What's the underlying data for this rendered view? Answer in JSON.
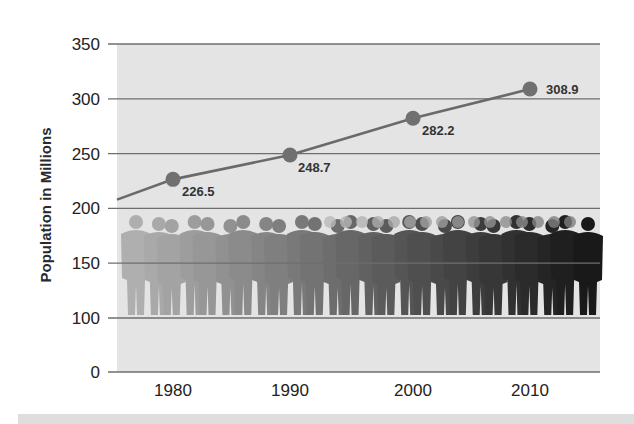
{
  "chart_data": {
    "type": "line",
    "title": "",
    "xlabel": "",
    "ylabel": "Population in Millions",
    "categories": [
      "1980",
      "1990",
      "2000",
      "2010"
    ],
    "series": [
      {
        "name": "Population",
        "values": [
          226.5,
          248.7,
          282.2,
          308.9
        ],
        "labels": [
          "226.5",
          "248.7",
          "282.2",
          "308.9"
        ]
      }
    ],
    "yticks": [
      "0",
      "100",
      "150",
      "200",
      "250",
      "300",
      "350"
    ],
    "ylim": [
      0,
      350
    ],
    "axis_break": "between 0 and 100",
    "grid": true,
    "legend": "none",
    "decoration": "silhouettes of people standing in a crowd, gradient from light gray (left) to black (right)",
    "colors": {
      "plot_background": "#e4e4e4",
      "gridline": "#6e6e6e",
      "line": "#6a6a6a",
      "marker": "#707070"
    }
  }
}
